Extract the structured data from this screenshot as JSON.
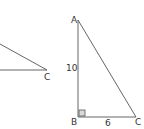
{
  "diagram": {
    "left_fragment": {
      "vertex_label": "C"
    },
    "right_triangle": {
      "vertices": {
        "A": "A",
        "B": "B",
        "C": "C"
      },
      "side_AB": "10",
      "side_BC": "6",
      "right_angle_at": "B"
    },
    "colors": {
      "line": "#555555",
      "text": "#333333",
      "right_angle_fill": "#d9d9d9"
    }
  }
}
